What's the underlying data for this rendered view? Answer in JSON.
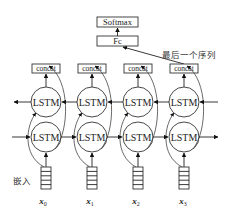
{
  "diagram": {
    "type": "bidirectional-lstm-architecture",
    "top": {
      "softmax_label": "Softmax",
      "fc_label": "Fc",
      "last_sequence_label": "最后一个序列"
    },
    "concat_label": "concat",
    "lstm_label": "LSTM",
    "embedding_label": "嵌入",
    "timesteps": [
      {
        "input": "x",
        "sub": "0"
      },
      {
        "input": "x",
        "sub": "1"
      },
      {
        "input": "x",
        "sub": "2"
      },
      {
        "input": "x",
        "sub": "3"
      }
    ],
    "colors": {
      "stroke": "#222222",
      "background": "#ffffff"
    }
  }
}
